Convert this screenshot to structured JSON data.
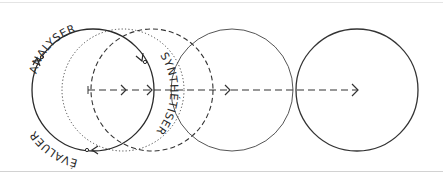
{
  "diagram": {
    "type": "design-process-cycle",
    "labels": {
      "analyse": "ANALYSER",
      "synthesise": "SYNTHÉTISER",
      "evaluate": "ÉVALUER"
    },
    "colors": {
      "stroke": "#333333",
      "background": "#ffffff"
    },
    "circles": [
      {
        "id": "cycle",
        "cx": 93,
        "cy": 90,
        "r": 61,
        "style": "solid"
      },
      {
        "id": "step-dotted",
        "cx": 123,
        "cy": 90,
        "r": 61,
        "style": "dotted"
      },
      {
        "id": "step-dashed",
        "cx": 152,
        "cy": 90,
        "r": 61,
        "style": "dashed"
      },
      {
        "id": "step-3",
        "cx": 232,
        "cy": 90,
        "r": 61,
        "style": "solid"
      },
      {
        "id": "step-4",
        "cx": 357,
        "cy": 90,
        "r": 61,
        "style": "solid"
      }
    ],
    "axis": {
      "x1": 88,
      "x2": 358,
      "y": 90,
      "style": "dashed",
      "arrows_at": [
        125,
        151,
        229,
        357
      ]
    }
  }
}
